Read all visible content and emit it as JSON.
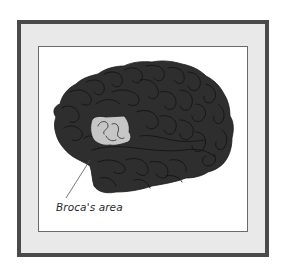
{
  "figure": {
    "label": "Broca's area",
    "colors": {
      "outer_border": "#4a4a4a",
      "mat": "#e9e9e9",
      "inner_border": "#6a6a6a",
      "panel": "#ffffff",
      "brain_fill": "#2e2e2e",
      "gyri_lines": "#151515",
      "broca_fill": "#c6c6c6",
      "leader_line": "#555555",
      "label_text": "#2a2a2a"
    }
  }
}
